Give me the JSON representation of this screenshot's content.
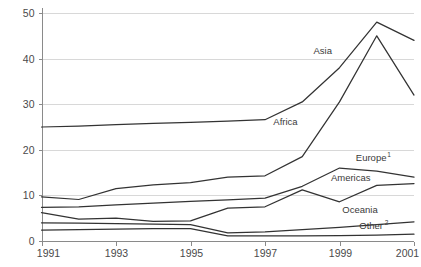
{
  "chart_data": {
    "type": "line",
    "title": "",
    "xlabel": "",
    "ylabel": "",
    "x": [
      1991,
      1992,
      1993,
      1994,
      1995,
      1996,
      1997,
      1998,
      1999,
      2000,
      2001
    ],
    "xlim": [
      1991,
      2001
    ],
    "ylim": [
      0,
      50
    ],
    "xticks": [
      "1991",
      "1993",
      "1995",
      "1997",
      "1999",
      "2001"
    ],
    "xtick_values": [
      1991,
      1993,
      1995,
      1997,
      1999,
      2001
    ],
    "yticks": [
      "0",
      "10",
      "20",
      "30",
      "40",
      "50"
    ],
    "ytick_values": [
      0,
      10,
      20,
      30,
      40,
      50
    ],
    "grid": true,
    "legend_position": "inline-labels",
    "series": [
      {
        "name": "Asia",
        "label": "Asia",
        "superscript": "",
        "values": [
          25.0,
          25.2,
          25.5,
          25.8,
          26.0,
          26.3,
          26.6,
          30.5,
          38.0,
          48.0,
          44.0
        ],
        "label_x": 1998.55,
        "label_y": 41.0
      },
      {
        "name": "Africa",
        "label": "Africa",
        "superscript": "",
        "values": [
          9.7,
          9.1,
          11.5,
          12.3,
          12.8,
          14.0,
          14.3,
          18.5,
          30.5,
          45.0,
          32.0
        ],
        "label_x": 1997.55,
        "label_y": 25.5
      },
      {
        "name": "Europe",
        "label": "Europe",
        "superscript": "1",
        "values": [
          7.4,
          7.5,
          7.9,
          8.3,
          8.7,
          9.0,
          9.4,
          12.0,
          16.0,
          15.3,
          14.0
        ],
        "label_x": 1999.85,
        "label_y": 17.6
      },
      {
        "name": "Americas",
        "label": "Americas",
        "superscript": "",
        "values": [
          6.2,
          4.8,
          5.0,
          4.3,
          4.4,
          7.2,
          7.5,
          11.2,
          8.6,
          12.2,
          12.6
        ],
        "label_x": 1999.3,
        "label_y": 13.1
      },
      {
        "name": "Oceania",
        "label": "Oceania",
        "superscript": "",
        "values": [
          4.0,
          3.9,
          3.8,
          3.7,
          3.6,
          1.8,
          2.0,
          2.5,
          3.0,
          3.6,
          4.2
        ],
        "label_x": 1999.55,
        "label_y": 6.1
      },
      {
        "name": "Other",
        "label": "Other",
        "superscript": "2",
        "values": [
          2.4,
          2.5,
          2.6,
          2.7,
          2.7,
          1.1,
          1.1,
          1.1,
          1.2,
          1.3,
          1.5
        ],
        "label_x": 1999.85,
        "label_y": 2.6
      }
    ]
  },
  "colors": {
    "line": "#333333",
    "grid": "#d8d8d8",
    "axis": "#8a8a8a",
    "text": "#3a3a3a",
    "background": "#ffffff"
  }
}
